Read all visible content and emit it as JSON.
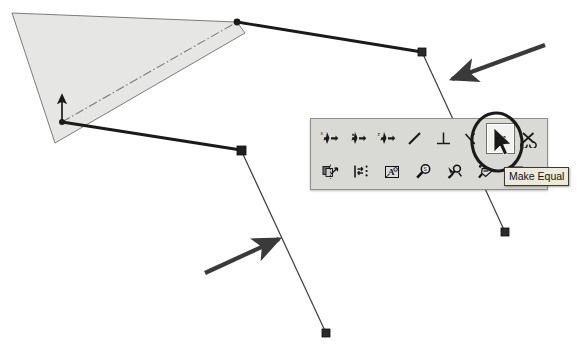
{
  "app": {
    "kind": "cad-sketch-screenshot",
    "background_color": "#ffffff"
  },
  "colors": {
    "plane_fill": "#e6e6e4",
    "plane_stroke": "#6e6e6c",
    "thick_line": "#1a1a1a",
    "thin_line": "#3c3c3c",
    "centerline": "#7a7a78",
    "annotation": "#3a3a3a",
    "toolbar_face": "#d9d9d6",
    "toolbar_border": "#8e8e8a",
    "button_pressed_face": "#f2f2ef",
    "tooltip_face": "#eceada",
    "tooltip_border": "#3a3a38",
    "tooltip_text": "#111111"
  },
  "tooltip": {
    "text": "Make Equal",
    "x": 504,
    "y": 167
  },
  "toolbar": {
    "x": 310,
    "y": 118,
    "width": 238,
    "height": 72,
    "rows": [
      [
        {
          "icon": "add-relation-icon",
          "label": "Add Relation",
          "pressed": false
        },
        {
          "icon": "display-relations-icon",
          "label": "Display/Delete Relations",
          "pressed": false
        },
        {
          "icon": "auto-relations-icon",
          "label": "Automatic Relations",
          "pressed": false
        },
        {
          "icon": "collinear-icon",
          "label": "Collinear",
          "pressed": false
        },
        {
          "icon": "perpendicular-icon",
          "label": "Perpendicular",
          "pressed": false
        },
        {
          "icon": "tangent-icon",
          "label": "Tangent",
          "pressed": false
        },
        {
          "icon": "make-equal-icon",
          "label": "Make Equal",
          "pressed": true
        },
        {
          "icon": "fix-icon",
          "label": "Fix",
          "pressed": false
        }
      ],
      [
        {
          "icon": "mirror-icon",
          "label": "Mirror Entities",
          "pressed": false
        },
        {
          "icon": "linear-pattern-icon",
          "label": "Linear Sketch Pattern",
          "pressed": false
        },
        {
          "icon": "modify-sketch-icon",
          "label": "Modify Sketch",
          "pressed": false
        },
        {
          "icon": "check-sketch-icon",
          "label": "Check Sketch For Feature",
          "pressed": false
        },
        {
          "icon": "repair-sketch-icon",
          "label": "Repair Sketch",
          "pressed": false
        },
        {
          "icon": "contour-select-icon",
          "label": "Contour Select Tool",
          "pressed": false
        },
        {
          "icon": "align-horizontal-icon",
          "label": "Align Horizontal",
          "pressed": false
        }
      ]
    ]
  },
  "sketch": {
    "plane": {
      "name": "sketch-plane",
      "points": "12,13 237,22 245,33 55,143",
      "label": "shaded reference plane"
    },
    "origin": {
      "name": "sketch-origin",
      "x": 62,
      "y": 122,
      "axis_arrow_tip_y": 93
    },
    "centerline": {
      "name": "construction-centerline",
      "x1": 62,
      "y1": 122,
      "x2": 237,
      "y2": 22,
      "style": "dash-dot"
    },
    "segments": [
      {
        "name": "segment-origin-to-vertex-b",
        "x1": 62,
        "y1": 122,
        "x2": 241,
        "y2": 150,
        "weight": "thick"
      },
      {
        "name": "segment-origin-to-top",
        "x1": 62,
        "y1": 122,
        "x2": 237,
        "y2": 22,
        "weight": "thick-hidden"
      },
      {
        "name": "segment-top-to-vertex-a",
        "x1": 237,
        "y1": 22,
        "x2": 422,
        "y2": 52,
        "weight": "thick"
      },
      {
        "name": "segment-vertex-a-down",
        "x1": 422,
        "y1": 52,
        "x2": 505,
        "y2": 232,
        "weight": "thin"
      },
      {
        "name": "segment-vertex-b-down",
        "x1": 241,
        "y1": 150,
        "x2": 326,
        "y2": 333,
        "weight": "thin"
      }
    ],
    "vertices": [
      {
        "name": "vertex-top",
        "x": 237,
        "y": 22,
        "shape": "dot"
      },
      {
        "name": "vertex-a",
        "x": 422,
        "y": 52,
        "shape": "square"
      },
      {
        "name": "vertex-b",
        "x": 241,
        "y": 150,
        "shape": "square"
      },
      {
        "name": "endpoint-right",
        "x": 505,
        "y": 232,
        "shape": "square"
      },
      {
        "name": "endpoint-bottom",
        "x": 326,
        "y": 333,
        "shape": "square"
      }
    ]
  },
  "annotations": {
    "arrows": [
      {
        "name": "annotation-arrow-upper-right",
        "x1": 545,
        "y1": 45,
        "x2": 450,
        "y2": 80,
        "points_at": "segment-vertex-a-down"
      },
      {
        "name": "annotation-arrow-lower-left",
        "x1": 205,
        "y1": 273,
        "x2": 281,
        "y2": 238,
        "points_at": "segment-vertex-b-down"
      }
    ],
    "ellipse": {
      "name": "annotation-ellipse-make-equal",
      "cx": 497,
      "cy": 142,
      "rx": 25,
      "ry": 29,
      "rotation": -8,
      "highlights": "make-equal-icon"
    },
    "cursor": {
      "name": "mouse-cursor",
      "x": 494,
      "y": 142
    }
  }
}
